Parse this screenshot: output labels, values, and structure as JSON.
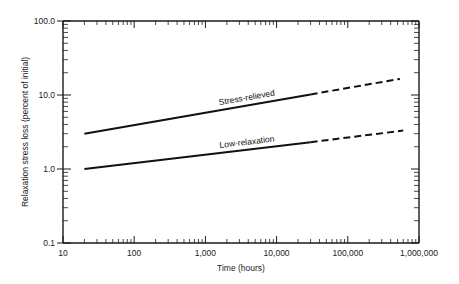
{
  "chart_data": {
    "type": "line",
    "title": "",
    "xlabel": "Time (hours)",
    "ylabel": "Relaxation stress loss (percent of initial)",
    "x_scale": "log",
    "y_scale": "log",
    "xlim": [
      10,
      1000000
    ],
    "ylim": [
      0.1,
      100
    ],
    "x_ticks": [
      10,
      100,
      1000,
      10000,
      100000,
      1000000
    ],
    "x_tick_labels": [
      "10",
      "100",
      "1,000",
      "10,000",
      "100,000",
      "1,000,000"
    ],
    "y_ticks": [
      0.1,
      1,
      10,
      100
    ],
    "y_tick_labels": [
      "0.1",
      "1.0",
      "10.0",
      "100.0"
    ],
    "grid": false,
    "legend": "none (lines labeled inline)",
    "series": [
      {
        "name": "Stress-relieved",
        "segments": [
          {
            "style": "solid",
            "points": [
              [
                20,
                3.0
              ],
              [
                30000,
                10.2
              ]
            ]
          },
          {
            "style": "dashed",
            "points": [
              [
                30000,
                10.2
              ],
              [
                540000,
                16.5
              ]
            ]
          }
        ]
      },
      {
        "name": "Low-relaxation",
        "segments": [
          {
            "style": "solid",
            "points": [
              [
                20,
                1.0
              ],
              [
                30000,
                2.3
              ]
            ]
          },
          {
            "style": "dashed",
            "points": [
              [
                30000,
                2.3
              ],
              [
                600000,
                3.3
              ]
            ]
          }
        ]
      }
    ]
  }
}
